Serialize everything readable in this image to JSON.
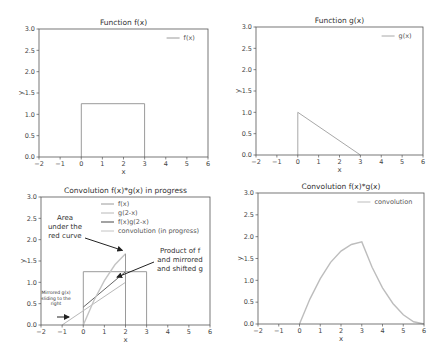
{
  "chart_data": [
    {
      "type": "line",
      "title": "Function f(x)",
      "xlabel": "x",
      "ylabel": "y",
      "xlim": [
        -2,
        6
      ],
      "ylim": [
        0,
        3.0
      ],
      "xticks": [
        "−2",
        "−1",
        "0",
        "1",
        "2",
        "3",
        "4",
        "5",
        "6"
      ],
      "yticks": [
        "0.0",
        "0.5",
        "1.0",
        "1.5",
        "2.0",
        "2.5",
        "3.0"
      ],
      "legend": [
        "f(x)"
      ],
      "legend_position": "upper right",
      "series": [
        {
          "name": "f(x)",
          "x": [
            0,
            0,
            3,
            3
          ],
          "y": [
            0,
            1.25,
            1.25,
            0
          ]
        }
      ]
    },
    {
      "type": "line",
      "title": "Function g(x)",
      "xlabel": "x",
      "ylabel": "y",
      "xlim": [
        -2,
        6
      ],
      "ylim": [
        0,
        3.0
      ],
      "xticks": [
        "−2",
        "−1",
        "0",
        "1",
        "2",
        "3",
        "4",
        "5",
        "6"
      ],
      "yticks": [
        "0.0",
        "0.5",
        "1.0",
        "1.5",
        "2.0",
        "2.5",
        "3.0"
      ],
      "legend": [
        "g(x)"
      ],
      "legend_position": "upper right",
      "series": [
        {
          "name": "g(x)",
          "x": [
            0,
            0,
            3
          ],
          "y": [
            0,
            1.0,
            0
          ]
        }
      ]
    },
    {
      "type": "line",
      "title": "Convolution f(x)*g(x) in progress",
      "xlabel": "x",
      "ylabel": "y",
      "xlim": [
        -2,
        6
      ],
      "ylim": [
        0,
        3.0
      ],
      "xticks": [
        "−2",
        "−1",
        "0",
        "1",
        "2",
        "3",
        "4",
        "5",
        "6"
      ],
      "yticks": [
        "0.0",
        "0.5",
        "1.0",
        "1.5",
        "2.0",
        "2.5",
        "3.0"
      ],
      "legend": [
        "f(x)",
        "g(2-x)",
        "f(x)g(2-x)",
        "convolution (in progress)"
      ],
      "legend_position": "upper right",
      "series": [
        {
          "name": "f(x)",
          "x": [
            0,
            0,
            3,
            3
          ],
          "y": [
            0,
            1.25,
            1.25,
            0
          ]
        },
        {
          "name": "g(2-x)",
          "x": [
            -1,
            2
          ],
          "y": [
            0,
            1.0
          ]
        },
        {
          "name": "f(x)g(2-x)",
          "x": [
            0,
            2
          ],
          "y": [
            0.42,
            1.25
          ]
        },
        {
          "name": "convolution (in progress)",
          "x": [
            0,
            0.5,
            1.0,
            1.5,
            2.0
          ],
          "y": [
            0,
            0.57,
            1.04,
            1.41,
            1.67
          ]
        }
      ],
      "annotations": [
        {
          "text": "Area under the red curve"
        },
        {
          "text": "Product of f and mirrored and shifted g"
        },
        {
          "text": "Mirrored g(x) sliding to the right"
        }
      ]
    },
    {
      "type": "line",
      "title": "Convolution f(x)*g(x)",
      "xlabel": "x",
      "ylabel": "y",
      "xlim": [
        -2,
        6
      ],
      "ylim": [
        0,
        3.0
      ],
      "xticks": [
        "−2",
        "−1",
        "0",
        "1",
        "2",
        "3",
        "4",
        "5",
        "6"
      ],
      "yticks": [
        "0.0",
        "0.5",
        "1.0",
        "1.5",
        "2.0",
        "2.5",
        "3.0"
      ],
      "legend": [
        "convolution"
      ],
      "legend_position": "upper right",
      "series": [
        {
          "name": "convolution",
          "x": [
            0,
            0.5,
            1.0,
            1.5,
            2.0,
            2.5,
            3.0,
            3.5,
            4.0,
            4.5,
            5.0,
            5.5,
            6.0
          ],
          "y": [
            0,
            0.57,
            1.04,
            1.41,
            1.67,
            1.82,
            1.88,
            1.3,
            0.83,
            0.47,
            0.21,
            0.05,
            0
          ]
        }
      ]
    }
  ],
  "panels": {
    "tl": {
      "title": "Function f(x)",
      "legend": [
        "f(x)"
      ]
    },
    "tr": {
      "title": "Function g(x)",
      "legend": [
        "g(x)"
      ]
    },
    "bl": {
      "title": "Convolution f(x)*g(x) in progress",
      "legend": [
        "f(x)",
        "g(2-x)",
        "f(x)g(2-x)",
        "convolution (in progress)"
      ]
    },
    "br": {
      "title": "Convolution f(x)*g(x)",
      "legend": [
        "convolution"
      ]
    }
  },
  "axis": {
    "xlabel": "x",
    "ylabel": "y",
    "xticks": [
      "−2",
      "−1",
      "0",
      "1",
      "2",
      "3",
      "4",
      "5",
      "6"
    ],
    "yticks": [
      "0.0",
      "0.5",
      "1.0",
      "1.5",
      "2.0",
      "2.5",
      "3.0"
    ]
  },
  "annotations": {
    "area": [
      "Area",
      "under the",
      "red curve"
    ],
    "product": [
      "Product of f",
      "and mirrored",
      "and shifted g"
    ],
    "mirrored": [
      "Mirrored g(x)",
      "sliding to the",
      "right"
    ]
  }
}
